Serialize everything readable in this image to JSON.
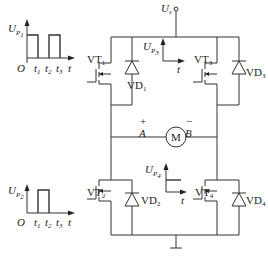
{
  "diagram": {
    "type": "H-bridge PWM motor drive",
    "supply_label": "U",
    "supply_sub": "s",
    "motor_label": "M",
    "node_a": {
      "label": "A",
      "polarity": "+"
    },
    "node_b": {
      "label": "B",
      "polarity": "−"
    },
    "switches": [
      {
        "id": "VT1",
        "base": "VT",
        "sub": "1",
        "diode_base": "VD",
        "diode_sub": "1",
        "position": "top-left"
      },
      {
        "id": "VT3",
        "base": "VT",
        "sub": "3",
        "diode_base": "VD",
        "diode_sub": "3",
        "position": "top-right"
      },
      {
        "id": "VT2",
        "base": "VT",
        "sub": "2",
        "diode_base": "VD",
        "diode_sub": "2",
        "position": "bottom-left"
      },
      {
        "id": "VT4",
        "base": "VT",
        "sub": "4",
        "diode_base": "VD",
        "diode_sub": "4",
        "position": "bottom-right"
      }
    ],
    "waveforms": [
      {
        "name": "UP1",
        "ylabel": "U",
        "ysub": "P",
        "ysub2": "1",
        "origin": "O",
        "ticks": [
          "t1",
          "t2",
          "t3"
        ],
        "tick_base": "t",
        "tick_subs": [
          "1",
          "2",
          "3"
        ],
        "xlabel": "t",
        "pulses": [
          [
            0,
            1
          ],
          [
            2,
            3
          ]
        ]
      },
      {
        "name": "UP2",
        "ylabel": "U",
        "ysub": "P",
        "ysub2": "2",
        "origin": "O",
        "ticks": [
          "t1",
          "t2",
          "t3"
        ],
        "tick_base": "t",
        "tick_subs": [
          "1",
          "2",
          "3"
        ],
        "xlabel": "t",
        "pulses": [
          [
            1,
            2
          ]
        ]
      },
      {
        "name": "UP3",
        "ylabel": "U",
        "ysub": "P",
        "ysub2": "3",
        "xlabel": "t",
        "level": "low"
      },
      {
        "name": "UP4",
        "ylabel": "U",
        "ysub": "P",
        "ysub2": "4",
        "xlabel": "t",
        "level": "high"
      }
    ]
  }
}
